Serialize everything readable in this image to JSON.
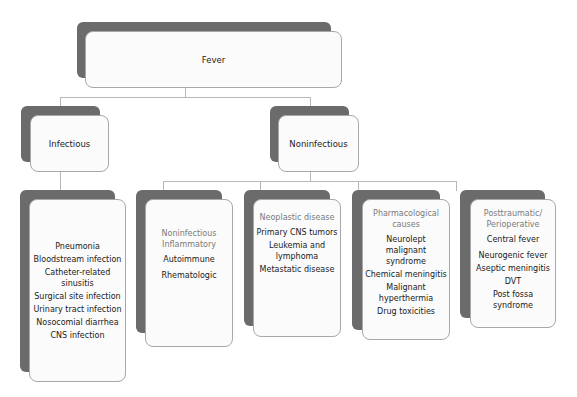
{
  "root": {
    "label": "Fever"
  },
  "level1": [
    {
      "label": "Infectious"
    },
    {
      "label": "Noninfectious"
    }
  ],
  "infectious": {
    "items": [
      "Pneumonia",
      "Bloodstream infection",
      "Catheter-related sinusitis",
      "Surgical site infection",
      "Urinary tract infection",
      "Nosocomial diarrhea",
      "CNS infection"
    ]
  },
  "noninfectious": [
    {
      "heading": "Noninfectious Inflammatory",
      "items": [
        "Autoimmune",
        "Rhematologic"
      ]
    },
    {
      "heading": "Neoplastic disease",
      "items": [
        "Primary CNS tumors",
        "Leukemia and lymphoma",
        "Metastatic disease"
      ]
    },
    {
      "heading": "Pharmacological causes",
      "items": [
        "Neurolept malignant syndrome",
        "Chemical meningitis",
        "Malignant hyperthermia",
        "Drug toxicities"
      ]
    },
    {
      "heading": "Posttraumatic/ Perioperative",
      "items": [
        "Central fever",
        "Neurogenic fever",
        "Aseptic meningitis",
        "DVT",
        "Post fossa syndrome"
      ]
    }
  ],
  "colors": {
    "shadow": "#6b6b6b",
    "box": "#fbfbfb",
    "border": "#a8a8a8",
    "connector": "#b8b8b8",
    "subheading": "#7a7a7a"
  }
}
